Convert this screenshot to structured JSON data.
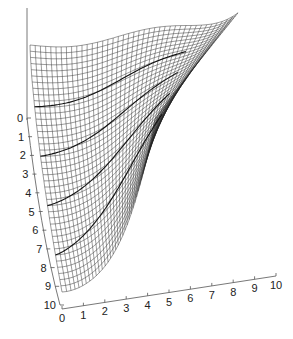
{
  "chart_data": {
    "type": "surface",
    "title": "",
    "xlabel": "",
    "ylabel": "",
    "zlabel": "",
    "x_ticks": [
      "0",
      "1",
      "2",
      "3",
      "4",
      "5",
      "6",
      "7",
      "8",
      "9",
      "10"
    ],
    "y_ticks": [
      "0",
      "1",
      "2",
      "3",
      "4",
      "5",
      "6",
      "7",
      "8",
      "9",
      "10"
    ],
    "xlim": [
      0,
      10
    ],
    "ylim": [
      0,
      10
    ],
    "grid": false,
    "legend": null,
    "mesh_resolution": 40
  },
  "colors": {
    "mesh": "#222222",
    "background": "#ffffff",
    "axis": "#555555"
  }
}
